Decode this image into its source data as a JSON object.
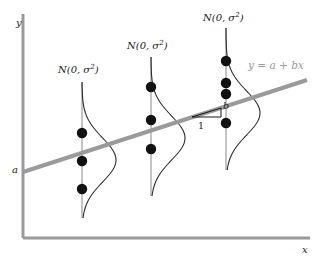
{
  "figure": {
    "background": "#ffffff"
  },
  "axes": {
    "y_label": "y",
    "x_label": "x",
    "intercept_label": "a",
    "color": "#9a9a9a",
    "x_axis": {
      "x1": 23,
      "y1": 238,
      "x2": 310,
      "y2": 238
    },
    "y_axis": {
      "x1": 23,
      "y1": 14,
      "x2": 23,
      "y2": 238
    }
  },
  "regression_line": {
    "equation_label": "y = a + bx",
    "color": "#9a9a9a",
    "x1": 23,
    "y1": 172,
    "x2": 307,
    "y2": 80,
    "width": 4
  },
  "slope_triangle": {
    "run_label": "1",
    "rise_label": "b",
    "apex_x": 192,
    "apex_y": 117,
    "corner_x": 221,
    "corner_y": 108,
    "base_x": 221,
    "base_y": 117
  },
  "distributions": [
    {
      "name": "group-1",
      "label": "N(0, σ",
      "label_sup": "2",
      "label_close": ")",
      "axis_x": 82,
      "axis_top": 82,
      "axis_bottom": 218,
      "mean_y": 160,
      "sigma": 22,
      "amplitude": 34,
      "points_y": [
        133,
        161,
        189
      ],
      "label_x": 58,
      "label_y": 64
    },
    {
      "name": "group-2",
      "label": "N(0, σ",
      "label_sup": "2",
      "label_close": ")",
      "axis_x": 151,
      "axis_top": 57,
      "axis_bottom": 196,
      "mean_y": 138,
      "sigma": 22,
      "amplitude": 34,
      "points_y": [
        87,
        120,
        149
      ],
      "label_x": 127,
      "label_y": 40
    },
    {
      "name": "group-3",
      "label": "N(0, σ",
      "label_sup": "2",
      "label_close": ")",
      "axis_x": 226,
      "axis_top": 28,
      "axis_bottom": 170,
      "mean_y": 113,
      "sigma": 22,
      "amplitude": 34,
      "points_y": [
        61,
        83,
        94,
        123
      ],
      "label_x": 203,
      "label_y": 12
    }
  ],
  "markers": {
    "dot_color": "#111111",
    "dot_radius": 5.2,
    "curve_color": "#2b2b2b",
    "stem_color": "#b5b5b5"
  }
}
